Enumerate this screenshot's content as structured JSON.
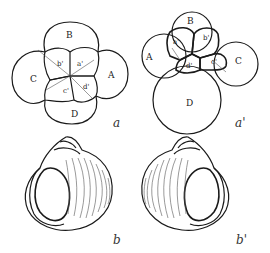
{
  "figure": {
    "panel_a": {
      "caption": "a",
      "macromeres": [
        "A",
        "B",
        "C",
        "D"
      ],
      "micromeres": [
        "a'",
        "b'",
        "c'",
        "d'"
      ]
    },
    "panel_a_prime": {
      "caption": "a'",
      "macromeres": [
        "A",
        "B",
        "C",
        "D"
      ],
      "micromeres": [
        "a'",
        "b'",
        "c'",
        "d'"
      ]
    },
    "panel_b": {
      "caption": "b"
    },
    "panel_b_prime": {
      "caption": "b'"
    }
  }
}
